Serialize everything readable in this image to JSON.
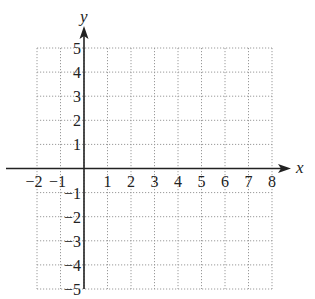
{
  "chart_data": {
    "type": "coordinate-grid",
    "title": "",
    "xlabel": "x",
    "ylabel": "y",
    "xlim": [
      -2,
      8
    ],
    "ylim": [
      -5,
      5
    ],
    "grid": true,
    "grid_style": "dotted",
    "x_ticks": [
      -2,
      -1,
      1,
      2,
      3,
      4,
      5,
      6,
      7,
      8
    ],
    "y_ticks": [
      -5,
      -4,
      -3,
      -2,
      -1,
      1,
      2,
      3,
      4,
      5
    ],
    "x_tick_labels": [
      "−2",
      "−1",
      "1",
      "2",
      "3",
      "4",
      "5",
      "6",
      "7",
      "8"
    ],
    "y_tick_labels": [
      "−5",
      "−4",
      "−3",
      "−2",
      "−1",
      "1",
      "2",
      "3",
      "4",
      "5"
    ],
    "series": []
  },
  "layout": {
    "origin_px": [
      84,
      168.5
    ],
    "x_unit_px": 23.5,
    "y_unit_px": 24.1,
    "axis_color": "#222222",
    "grid_color": "#9a9a9a",
    "x_axis_end_px": 291,
    "y_axis_top_px": 26
  }
}
